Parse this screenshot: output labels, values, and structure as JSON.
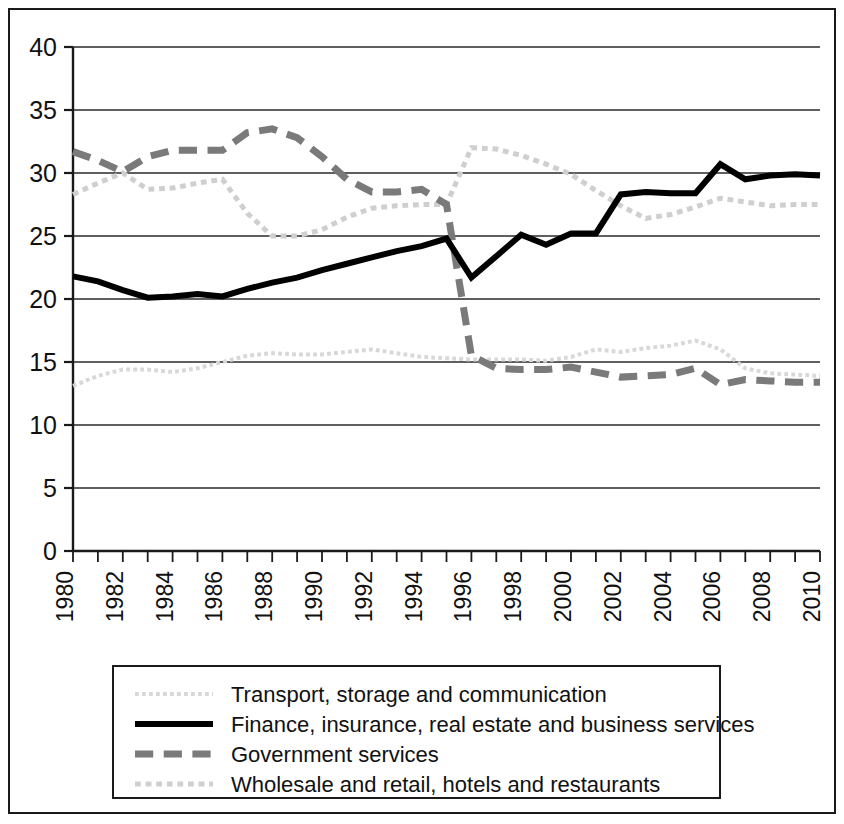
{
  "chart_data": {
    "type": "line",
    "title": "",
    "subtitle": "",
    "xlabel": "",
    "ylabel": "",
    "xlim": [
      1980,
      2010
    ],
    "ylim": [
      0,
      40
    ],
    "y_ticks": [
      0,
      5,
      10,
      15,
      20,
      25,
      30,
      35,
      40
    ],
    "y_tick_labels": [
      "0",
      "5",
      "10",
      "15",
      "20",
      "25",
      "30",
      "35",
      "40"
    ],
    "x_ticks": [
      1980,
      1981,
      1982,
      1983,
      1984,
      1985,
      1986,
      1987,
      1988,
      1989,
      1990,
      1991,
      1992,
      1993,
      1994,
      1995,
      1996,
      1997,
      1998,
      1999,
      2000,
      2001,
      2002,
      2003,
      2004,
      2005,
      2006,
      2007,
      2008,
      2009,
      2010
    ],
    "x_tick_labels": [
      "1980",
      "",
      "1982",
      "",
      "1984",
      "",
      "1986",
      "",
      "1988",
      "",
      "1990",
      "",
      "1992",
      "",
      "1994",
      "",
      "1996",
      "",
      "1998",
      "",
      "2000",
      "",
      "2002",
      "",
      "2004",
      "",
      "2006",
      "",
      "2008",
      "",
      "2010"
    ],
    "x": [
      1980,
      1981,
      1982,
      1983,
      1984,
      1985,
      1986,
      1987,
      1988,
      1989,
      1990,
      1991,
      1992,
      1993,
      1994,
      1995,
      1996,
      1997,
      1998,
      1999,
      2000,
      2001,
      2002,
      2003,
      2004,
      2005,
      2006,
      2007,
      2008,
      2009,
      2010
    ],
    "grid": "horizontal",
    "legend_position": "bottom",
    "series": [
      {
        "name": "Transport, storage and communication",
        "color": "#d8d8d8",
        "style": "dotted",
        "width": 4,
        "values": [
          13.1,
          13.9,
          14.4,
          14.4,
          14.2,
          14.5,
          15.0,
          15.5,
          15.7,
          15.6,
          15.6,
          15.8,
          16.0,
          15.7,
          15.4,
          15.3,
          15.2,
          15.2,
          15.2,
          15.1,
          15.4,
          16.0,
          15.8,
          16.1,
          16.3,
          16.7,
          16.0,
          14.5,
          14.1,
          14.0,
          13.9
        ]
      },
      {
        "name": "Finance, insurance, real estate and business services",
        "color": "#000000",
        "style": "solid",
        "width": 6,
        "values": [
          21.8,
          21.4,
          20.7,
          20.1,
          20.2,
          20.4,
          20.2,
          20.8,
          21.3,
          21.7,
          22.3,
          22.8,
          23.3,
          23.8,
          24.2,
          24.8,
          21.7,
          23.4,
          25.1,
          24.3,
          25.2,
          25.2,
          28.3,
          28.5,
          28.4,
          28.4,
          30.7,
          29.5,
          29.8,
          29.9,
          29.8
        ]
      },
      {
        "name": "Government services",
        "color": "#7a7a7a",
        "style": "dashed",
        "width": 7,
        "values": [
          31.7,
          31.0,
          30.1,
          31.3,
          31.8,
          31.8,
          31.8,
          33.2,
          33.5,
          32.8,
          31.3,
          29.5,
          28.5,
          28.5,
          28.7,
          27.5,
          15.5,
          14.5,
          14.4,
          14.4,
          14.6,
          14.2,
          13.8,
          13.9,
          14.0,
          14.5,
          13.2,
          13.6,
          13.5,
          13.4,
          13.4
        ]
      },
      {
        "name": "Wholesale and retail, hotels and restaurants",
        "color": "#cfcfcf",
        "style": "dotted-dense",
        "width": 5,
        "values": [
          28.3,
          29.2,
          30.0,
          28.7,
          28.8,
          29.2,
          29.5,
          26.8,
          25.0,
          25.0,
          25.5,
          26.5,
          27.2,
          27.4,
          27.5,
          27.5,
          32.0,
          31.9,
          31.4,
          30.7,
          29.9,
          28.6,
          27.4,
          26.4,
          26.7,
          27.3,
          28.0,
          27.7,
          27.4,
          27.5,
          27.5
        ]
      }
    ],
    "legend_entries": [
      {
        "label": "Transport, storage and communication",
        "color": "#d8d8d8",
        "style": "dotted"
      },
      {
        "label": "Finance, insurance, real estate and business services",
        "color": "#000000",
        "style": "solid"
      },
      {
        "label": "Government services",
        "color": "#7a7a7a",
        "style": "dashed"
      },
      {
        "label": "Wholesale and retail, hotels and restaurants",
        "color": "#cfcfcf",
        "style": "dotted-dense"
      }
    ]
  }
}
